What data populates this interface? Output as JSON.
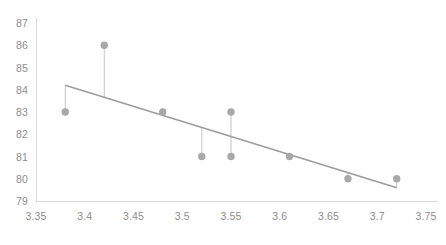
{
  "chart_data": {
    "type": "scatter",
    "title": "",
    "subtitle": "",
    "xlabel": "",
    "ylabel": "",
    "xlim": [
      3.35,
      3.75
    ],
    "ylim": [
      79,
      87
    ],
    "x_ticks": [
      "3.35",
      "3.4",
      "3.45",
      "3.5",
      "3.55",
      "3.6",
      "3.65",
      "3.7",
      "3.75"
    ],
    "x_tick_values": [
      3.35,
      3.4,
      3.45,
      3.5,
      3.55,
      3.6,
      3.65,
      3.7,
      3.75
    ],
    "y_ticks": [
      "87",
      "86",
      "85",
      "84",
      "83",
      "82",
      "81",
      "80",
      "79"
    ],
    "y_tick_values": [
      87,
      86,
      85,
      84,
      83,
      82,
      81,
      80,
      79
    ],
    "grid": false,
    "legend": "none",
    "series": [
      {
        "name": "observations",
        "type": "scatter",
        "marker": "circle",
        "color": "#a8a8a8",
        "points": [
          {
            "x": 3.38,
            "y": 83
          },
          {
            "x": 3.42,
            "y": 86
          },
          {
            "x": 3.48,
            "y": 83
          },
          {
            "x": 3.52,
            "y": 81
          },
          {
            "x": 3.55,
            "y": 83
          },
          {
            "x": 3.55,
            "y": 81
          },
          {
            "x": 3.61,
            "y": 81
          },
          {
            "x": 3.67,
            "y": 80
          },
          {
            "x": 3.72,
            "y": 80
          }
        ]
      },
      {
        "name": "trend-line",
        "type": "line",
        "color": "#9c9c9c",
        "points": [
          {
            "x": 3.38,
            "y": 84.2
          },
          {
            "x": 3.72,
            "y": 79.6
          }
        ]
      },
      {
        "name": "residual-connectors",
        "type": "segments",
        "color": "#c4c4c4",
        "segments": [
          {
            "x": 3.38,
            "y1": 83,
            "y2": 84.2
          },
          {
            "x": 3.42,
            "y1": 86,
            "y2": 83.66
          },
          {
            "x": 3.48,
            "y1": 83,
            "y2": 82.85
          },
          {
            "x": 3.52,
            "y1": 81,
            "y2": 82.31
          },
          {
            "x": 3.55,
            "y1": 83,
            "y2": 81.91
          },
          {
            "x": 3.55,
            "y1": 81,
            "y2": 81.91
          },
          {
            "x": 3.61,
            "y1": 81,
            "y2": 81.1
          },
          {
            "x": 3.67,
            "y1": 80,
            "y2": 80.29
          },
          {
            "x": 3.72,
            "y1": 80,
            "y2": 79.6
          }
        ]
      }
    ]
  },
  "axes": {
    "axis_color": "#d9d9d9",
    "tick_label_color": "#8c8c8c",
    "plot_background": "#ffffff"
  }
}
